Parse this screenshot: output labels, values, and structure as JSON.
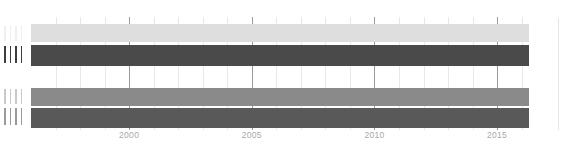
{
  "chart_data": {
    "type": "bar",
    "orientation": "horizontal",
    "title": "",
    "xlabel": "",
    "ylabel": "",
    "xlim": [
      1996,
      2016.3
    ],
    "grid": true,
    "legend": null,
    "xticks": [
      {
        "value": 2000,
        "label": "2000"
      },
      {
        "value": 2005,
        "label": "2005"
      },
      {
        "value": 2010,
        "label": "2010"
      },
      {
        "value": 2015,
        "label": "2015"
      }
    ],
    "minor_gridline_years": [
      1997,
      1998,
      1999,
      2001,
      2002,
      2003,
      2004,
      2006,
      2007,
      2008,
      2009,
      2011,
      2012,
      2013,
      2014,
      2016
    ],
    "major_gridline_years": [
      2000,
      2005,
      2010,
      2015
    ],
    "categories": [
      {
        "label": "||||",
        "glyph_count": 4,
        "legible": false
      },
      {
        "label": "||||",
        "glyph_count": 4,
        "legible": false
      },
      {
        "label": "||||",
        "glyph_count": 4,
        "legible": false
      },
      {
        "label": "||||",
        "glyph_count": 4,
        "legible": false
      }
    ],
    "bars": [
      {
        "category_index": 0,
        "start": 1996,
        "end": 2016.3,
        "color": "#dedede",
        "top_px": 7,
        "height_px": 18
      },
      {
        "category_index": 1,
        "start": 1996,
        "end": 2016.3,
        "color": "#4a4a4a",
        "top_px": 28,
        "height_px": 21
      },
      {
        "category_index": 2,
        "start": 1996,
        "end": 2016.3,
        "color": "#8a8a8a",
        "top_px": 71,
        "height_px": 18
      },
      {
        "category_index": 3,
        "start": 1996,
        "end": 2016.3,
        "color": "#595959",
        "top_px": 91,
        "height_px": 20
      }
    ]
  },
  "axis_labels": [
    {
      "glyph_count": 4,
      "color": "#efefef",
      "top_px": 26,
      "height_px": 15
    },
    {
      "glyph_count": 4,
      "color": "#3d3d3d",
      "top_px": 46,
      "height_px": 17
    },
    {
      "glyph_count": 4,
      "color": "#c9c9c9",
      "top_px": 89,
      "height_px": 15
    },
    {
      "glyph_count": 4,
      "color": "#9b9b9b",
      "top_px": 108,
      "height_px": 17
    }
  ],
  "colors": {
    "background": "#ffffff",
    "gridline_minor": "#e8e8e8",
    "gridline_major": "#9a9a9a",
    "tick_text": "#a8a8a8",
    "divider": "#e4e4e4"
  }
}
